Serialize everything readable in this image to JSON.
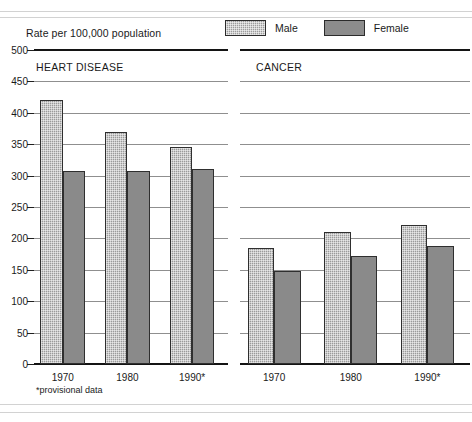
{
  "axis_title": "Rate per 100,000 population",
  "legend": {
    "items": [
      {
        "label": "Male",
        "swatch": "male-hatch-swatch"
      },
      {
        "label": "Female",
        "swatch": "female-solid-swatch"
      }
    ]
  },
  "footnote": "*provisional data",
  "panels": [
    {
      "title": "HEART DISEASE"
    },
    {
      "title": "CANCER"
    }
  ],
  "y_ticks": [
    "500",
    "450",
    "400",
    "350",
    "300",
    "250",
    "200",
    "150",
    "100",
    "50",
    "0"
  ],
  "x_ticks": [
    "1970",
    "1980",
    "1990*"
  ],
  "colors": {
    "male": "#9a9a9a",
    "female": "#8a8a8a",
    "gridline": "#8f8f8f",
    "axis": "#141414",
    "rule": "#d2d2d2"
  },
  "chart_data": {
    "type": "bar",
    "title": "Rate per 100,000 population",
    "xlabel": "",
    "ylabel": "Rate per 100,000 population",
    "ylim": [
      0,
      500
    ],
    "ytick_step": 50,
    "grid": true,
    "legend_position": "top-right",
    "categories": [
      "1970",
      "1980",
      "1990*"
    ],
    "panels": [
      {
        "name": "HEART DISEASE",
        "series": [
          {
            "name": "Male",
            "values": [
              420,
              370,
              345
            ]
          },
          {
            "name": "Female",
            "values": [
              307,
              308,
              310
            ]
          }
        ]
      },
      {
        "name": "CANCER",
        "series": [
          {
            "name": "Male",
            "values": [
              185,
              210,
              222
            ]
          },
          {
            "name": "Female",
            "values": [
              148,
              172,
              188
            ]
          }
        ]
      }
    ],
    "annotations": [
      "*provisional data"
    ]
  }
}
